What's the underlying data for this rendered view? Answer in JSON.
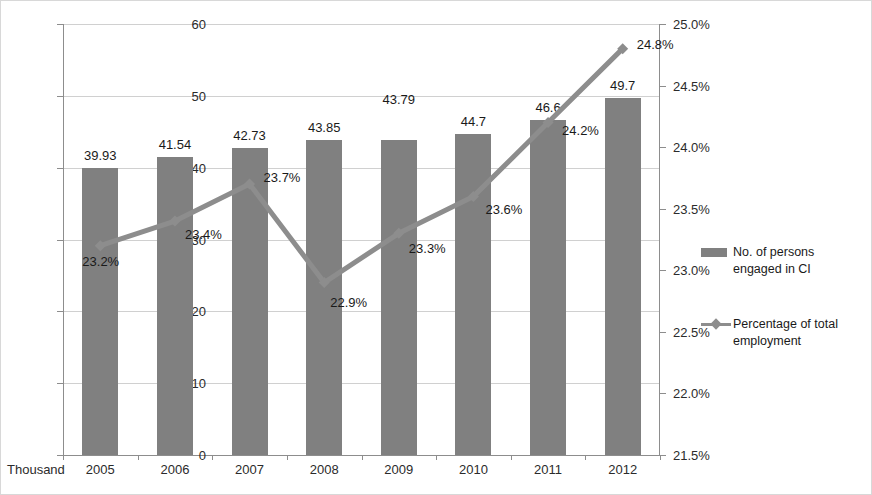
{
  "axis": {
    "unit_label": "Thousand",
    "left_ticks": [
      "0",
      "10",
      "20",
      "30",
      "40",
      "50",
      "60"
    ],
    "right_ticks": [
      "21.5%",
      "22.0%",
      "22.5%",
      "23.0%",
      "23.5%",
      "24.0%",
      "24.5%",
      "25.0%"
    ]
  },
  "legend": {
    "items": [
      {
        "label_line1": "No. of persons",
        "label_line2": "engaged in CI",
        "type": "bar",
        "color": "#808080"
      },
      {
        "label_line1": "Percentage of total",
        "label_line2": "employment",
        "type": "line",
        "color": "#8d8d8d"
      }
    ]
  },
  "chart_data": {
    "type": "bar",
    "title": "",
    "xlabel": "",
    "ylabel": "Thousand",
    "categories": [
      "2005",
      "2006",
      "2007",
      "2008",
      "2009",
      "2010",
      "2011",
      "2012"
    ],
    "ylim": [
      0,
      60
    ],
    "y2lim": [
      21.5,
      25.0
    ],
    "grid": true,
    "legend_position": "right",
    "series": [
      {
        "name": "No. of persons engaged in CI",
        "type": "bar",
        "axis": "left",
        "color": "#808080",
        "values": [
          39.93,
          41.54,
          42.73,
          43.85,
          43.79,
          44.7,
          46.6,
          49.7
        ],
        "labels": [
          "39.93",
          "41.54",
          "42.73",
          "43.85",
          "43.79",
          "44.7",
          "46.6",
          "49.7"
        ]
      },
      {
        "name": "Percentage of total employment",
        "type": "line",
        "axis": "right",
        "color": "#8d8d8d",
        "values": [
          23.2,
          23.4,
          23.7,
          22.9,
          23.3,
          23.6,
          24.2,
          24.8
        ],
        "labels": [
          "23.2%",
          "23.4%",
          "23.7%",
          "22.9%",
          "23.3%",
          "23.6%",
          "24.2%",
          "24.8%"
        ]
      }
    ]
  }
}
